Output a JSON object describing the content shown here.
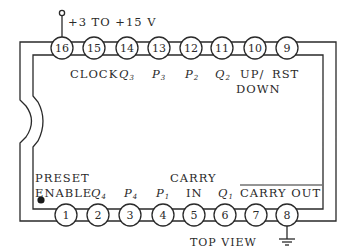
{
  "diagram": {
    "type": "ic-pinout",
    "view_label": "TOP VIEW",
    "supply_label": "+3 TO +15 V",
    "colors": {
      "ink": "#2a2a2a",
      "background": "#ffffff"
    },
    "top_pins": [
      {
        "number": "16",
        "label": ""
      },
      {
        "number": "15",
        "label": "CLOCK"
      },
      {
        "number": "14",
        "label": "Q",
        "sub": "3"
      },
      {
        "number": "13",
        "label": "P",
        "sub": "3"
      },
      {
        "number": "12",
        "label": "P",
        "sub": "2"
      },
      {
        "number": "11",
        "label": "Q",
        "sub": "2"
      },
      {
        "number": "10",
        "label": "UP/",
        "label2": "DOWN"
      },
      {
        "number": "9",
        "label": "RST"
      }
    ],
    "bottom_pins": [
      {
        "number": "1",
        "label": "PRESET",
        "label2": "ENABLE"
      },
      {
        "number": "2",
        "label": "Q",
        "sub": "4"
      },
      {
        "number": "3",
        "label": "P",
        "sub": "4"
      },
      {
        "number": "4",
        "label": "P",
        "sub": "1"
      },
      {
        "number": "5",
        "label": "CARRY",
        "label2": "IN"
      },
      {
        "number": "6",
        "label": "Q",
        "sub": "1"
      },
      {
        "number": "7",
        "label": "CARRY OUT",
        "overbar": true
      },
      {
        "number": "8",
        "label": ""
      }
    ],
    "pin1_marker": "filled-dot",
    "ground_symbol_pin": "8",
    "supply_pin": "16"
  }
}
